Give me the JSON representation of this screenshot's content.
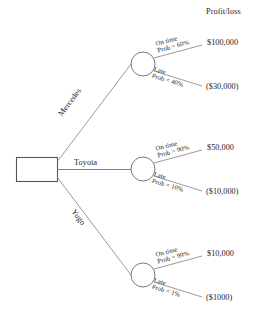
{
  "diagram": {
    "header_label": "Profit/loss",
    "decision_node_name": "decision-box",
    "line_color": "#555555",
    "text_color": "#1c1c1c",
    "background": "#ffffff"
  },
  "alternatives": [
    {
      "id": "mercedes",
      "label": "Mercedes",
      "outcomes": [
        {
          "id": "mercedes-on-time",
          "state": "On time",
          "prob": "Prob = 60%",
          "payoff": "$100,000"
        },
        {
          "id": "mercedes-late",
          "state": "Late",
          "prob": "Prob = 40%",
          "payoff": "($30,000)"
        }
      ]
    },
    {
      "id": "toyota",
      "label": "Toyota",
      "outcomes": [
        {
          "id": "toyota-on-time",
          "state": "On time",
          "prob": "Prob = 90%",
          "payoff": "$50,000"
        },
        {
          "id": "toyota-late",
          "state": "Late",
          "prob": "Prob = 10%",
          "payoff": "($10,000)"
        }
      ]
    },
    {
      "id": "yugo",
      "label": "Yugo",
      "outcomes": [
        {
          "id": "yugo-on-time",
          "state": "On time",
          "prob": "Prob = 99%",
          "payoff": "$10,000"
        },
        {
          "id": "yugo-late",
          "state": "Late",
          "prob": "Prob = 1%",
          "payoff": "($1000)"
        }
      ]
    }
  ]
}
